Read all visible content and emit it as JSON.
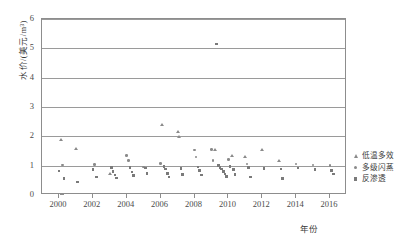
{
  "chart_data": {
    "type": "scatter",
    "title": "",
    "xlabel": "年份",
    "ylabel": "水价/(美元/m³)",
    "xlim": [
      1999,
      2017
    ],
    "ylim": [
      0,
      6
    ],
    "grid": true,
    "legend_position": "right",
    "xticks": [
      "2000",
      "2002",
      "2004",
      "2006",
      "2008",
      "2010",
      "2012",
      "2014",
      "2016"
    ],
    "xtick_values": [
      2000,
      2002,
      2004,
      2006,
      2008,
      2010,
      2012,
      2014,
      2016
    ],
    "yticks": [
      "0",
      "1",
      "2",
      "3",
      "4",
      "5",
      "6"
    ],
    "ytick_values": [
      0,
      1,
      2,
      3,
      4,
      5,
      6
    ],
    "series": [
      {
        "name": "低温多效",
        "marker": "triangle",
        "color": "#8a8a8a",
        "points": [
          [
            2000.1,
            1.86
          ],
          [
            2001.0,
            1.58
          ],
          [
            2003.0,
            0.72
          ],
          [
            2006.1,
            2.4
          ],
          [
            2007.0,
            2.15
          ],
          [
            2007.1,
            1.97
          ],
          [
            2009.2,
            1.53
          ],
          [
            2010.2,
            1.34
          ],
          [
            2011.0,
            1.31
          ],
          [
            2012.0,
            1.52
          ],
          [
            2013.0,
            1.16
          ]
        ]
      },
      {
        "name": "多级闪蒸",
        "marker": "circle",
        "color": "#8a8a8a",
        "points": [
          [
            2000.2,
            1.02
          ],
          [
            2002.1,
            1.04
          ],
          [
            2004.0,
            1.35
          ],
          [
            2004.1,
            1.18
          ],
          [
            2005.0,
            0.96
          ],
          [
            2006.0,
            1.08
          ],
          [
            2008.0,
            1.53
          ],
          [
            2008.1,
            1.3
          ],
          [
            2009.0,
            1.55
          ],
          [
            2009.1,
            1.18
          ],
          [
            2010.0,
            1.22
          ],
          [
            2011.1,
            1.06
          ],
          [
            2014.0,
            1.06
          ],
          [
            2015.0,
            1.02
          ],
          [
            2016.0,
            1.0
          ]
        ]
      },
      {
        "name": "反渗透",
        "marker": "square",
        "color": "#7a7a7a",
        "points": [
          [
            2000.0,
            0.82
          ],
          [
            2000.3,
            0.56
          ],
          [
            2001.1,
            0.44
          ],
          [
            2002.0,
            0.86
          ],
          [
            2002.2,
            0.62
          ],
          [
            2003.1,
            0.94
          ],
          [
            2003.2,
            0.8
          ],
          [
            2003.3,
            0.68
          ],
          [
            2003.4,
            0.58
          ],
          [
            2004.2,
            0.94
          ],
          [
            2004.3,
            0.78
          ],
          [
            2004.4,
            0.66
          ],
          [
            2005.1,
            0.92
          ],
          [
            2005.2,
            0.74
          ],
          [
            2006.2,
            0.98
          ],
          [
            2006.3,
            0.88
          ],
          [
            2006.4,
            0.74
          ],
          [
            2006.5,
            0.62
          ],
          [
            2007.2,
            0.9
          ],
          [
            2007.3,
            0.7
          ],
          [
            2008.2,
            0.96
          ],
          [
            2008.3,
            0.84
          ],
          [
            2008.4,
            0.68
          ],
          [
            2009.3,
            5.15
          ],
          [
            2009.4,
            1.0
          ],
          [
            2009.5,
            0.94
          ],
          [
            2009.6,
            0.88
          ],
          [
            2009.7,
            0.8
          ],
          [
            2009.8,
            0.72
          ],
          [
            2009.9,
            0.64
          ],
          [
            2010.1,
            0.98
          ],
          [
            2010.3,
            0.86
          ],
          [
            2010.4,
            0.7
          ],
          [
            2011.2,
            0.94
          ],
          [
            2011.3,
            0.62
          ],
          [
            2012.1,
            0.9
          ],
          [
            2013.1,
            0.88
          ],
          [
            2013.2,
            0.56
          ],
          [
            2014.1,
            0.92
          ],
          [
            2015.1,
            0.86
          ],
          [
            2016.1,
            0.84
          ],
          [
            2016.2,
            0.72
          ]
        ]
      }
    ]
  }
}
